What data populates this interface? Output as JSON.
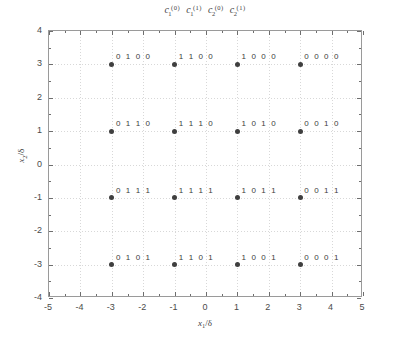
{
  "chart_data": {
    "type": "scatter",
    "title_terms": [
      {
        "base": "c",
        "sub": "1",
        "sup": "(0)"
      },
      {
        "base": "c",
        "sub": "1",
        "sup": "(1)"
      },
      {
        "base": "c",
        "sub": "2",
        "sup": "(0)"
      },
      {
        "base": "c",
        "sub": "2",
        "sup": "(1)"
      }
    ],
    "xlabel": "x_1/δ",
    "ylabel": "x_2/δ",
    "xlabel_parts": {
      "base": "x",
      "sub": "1",
      "rest": "/δ"
    },
    "ylabel_parts": {
      "base": "x",
      "sub": "2",
      "rest": "/δ"
    },
    "xlim": [
      -5,
      5
    ],
    "ylim": [
      -4,
      4
    ],
    "xticks": [
      -5,
      -4,
      -3,
      -2,
      -1,
      0,
      1,
      2,
      3,
      4,
      5
    ],
    "xticklabels": [
      "-5",
      "-4",
      "-3",
      "-2",
      "-1",
      "0",
      "1",
      "2",
      "3",
      "4",
      "5"
    ],
    "yticks": [
      -4,
      -3,
      -2,
      -1,
      0,
      1,
      2,
      3,
      4
    ],
    "yticklabels": [
      "-4",
      "-3",
      "-2",
      "-1",
      "0",
      "1",
      "2",
      "3",
      "4"
    ],
    "xticks_minor": [
      -4.5,
      -3.5,
      -2.5,
      -1.5,
      -0.5,
      0.5,
      1.5,
      2.5,
      3.5,
      4.5
    ],
    "yticks_minor": [
      -3.5,
      -2.5,
      -1.5,
      -0.5,
      0.5,
      1.5,
      2.5,
      3.5
    ],
    "grid": true,
    "grid_style": "dotted",
    "legend": "none",
    "marker_color": "#3f3f3f",
    "marker_shape": "circle",
    "grid_color": "#d8d8d8",
    "frame_color": "#9a9a9a",
    "points": [
      {
        "x": -3,
        "y": 3,
        "label": "0 1 0 0"
      },
      {
        "x": -1,
        "y": 3,
        "label": "1 1 0 0"
      },
      {
        "x": 1,
        "y": 3,
        "label": "1 0 0 0"
      },
      {
        "x": 3,
        "y": 3,
        "label": "0 0 0 0"
      },
      {
        "x": -3,
        "y": 1,
        "label": "0 1 1 0"
      },
      {
        "x": -1,
        "y": 1,
        "label": "1 1 1 0"
      },
      {
        "x": 1,
        "y": 1,
        "label": "1 0 1 0"
      },
      {
        "x": 3,
        "y": 1,
        "label": "0 0 1 0"
      },
      {
        "x": -3,
        "y": -1,
        "label": "0 1 1 1"
      },
      {
        "x": -1,
        "y": -1,
        "label": "1 1 1 1"
      },
      {
        "x": 1,
        "y": -1,
        "label": "1 0 1 1"
      },
      {
        "x": 3,
        "y": -1,
        "label": "0 0 1 1"
      },
      {
        "x": -3,
        "y": -3,
        "label": "0 1 0 1"
      },
      {
        "x": -1,
        "y": -3,
        "label": "1 1 0 1"
      },
      {
        "x": 1,
        "y": -3,
        "label": "1 0 0 1"
      },
      {
        "x": 3,
        "y": -3,
        "label": "0 0 0 1"
      }
    ]
  }
}
